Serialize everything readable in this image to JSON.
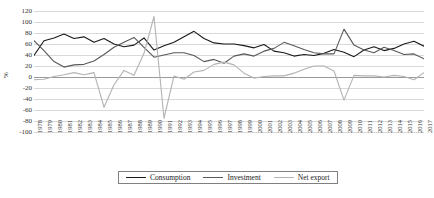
{
  "chart_data": {
    "type": "line",
    "title": "",
    "xlabel": "",
    "ylabel": "%",
    "ylim": [
      -100,
      120
    ],
    "ytick_step": 20,
    "yticks": [
      120,
      100,
      80,
      60,
      40,
      20,
      0,
      -20,
      -40,
      -60,
      -80,
      -100
    ],
    "grid": true,
    "legend_position": "bottom-center",
    "categories": [
      "1978",
      "1979",
      "1980",
      "1981",
      "1982",
      "1983",
      "1984",
      "1985",
      "1986",
      "1987",
      "1988",
      "1989",
      "1990",
      "1991",
      "1992",
      "1993",
      "1994",
      "1995",
      "1996",
      "1997",
      "1998",
      "1999",
      "2000",
      "2001",
      "2002",
      "2003",
      "2004",
      "2005",
      "2006",
      "2007",
      "2008",
      "2009",
      "2010",
      "2011",
      "2012",
      "2013",
      "2014",
      "2015",
      "2016",
      "2017"
    ],
    "series": [
      {
        "name": "Consumption",
        "color": "#1a1a1a",
        "values": [
          39,
          66,
          71,
          78,
          70,
          73,
          63,
          70,
          60,
          55,
          58,
          71,
          49,
          57,
          63,
          73,
          83,
          70,
          62,
          60,
          60,
          57,
          53,
          59,
          47,
          44,
          38,
          41,
          39,
          43,
          50,
          45,
          37,
          49,
          55,
          48,
          52,
          60,
          65,
          56
        ]
      },
      {
        "name": "Investment",
        "color": "#595959",
        "values": [
          66,
          48,
          28,
          18,
          22,
          23,
          29,
          41,
          54,
          63,
          72,
          54,
          36,
          40,
          44,
          44,
          39,
          28,
          32,
          25,
          38,
          42,
          38,
          47,
          52,
          63,
          57,
          50,
          44,
          42,
          42,
          87,
          58,
          49,
          44,
          54,
          48,
          41,
          42,
          33
        ]
      },
      {
        "name": "Net export",
        "color": "#b3b3b3",
        "values": [
          -5,
          -4,
          1,
          4,
          8,
          4,
          8,
          -55,
          -14,
          12,
          3,
          43,
          110,
          -75,
          2,
          -4,
          9,
          12,
          23,
          27,
          22,
          7,
          -2,
          1,
          2,
          2,
          7,
          14,
          20,
          20,
          11,
          -42,
          3,
          2,
          2,
          0,
          3,
          1,
          -5,
          8
        ]
      }
    ]
  },
  "legend": {
    "items": [
      {
        "label": "Consumption"
      },
      {
        "label": "Investment"
      },
      {
        "label": "Net export"
      }
    ]
  }
}
